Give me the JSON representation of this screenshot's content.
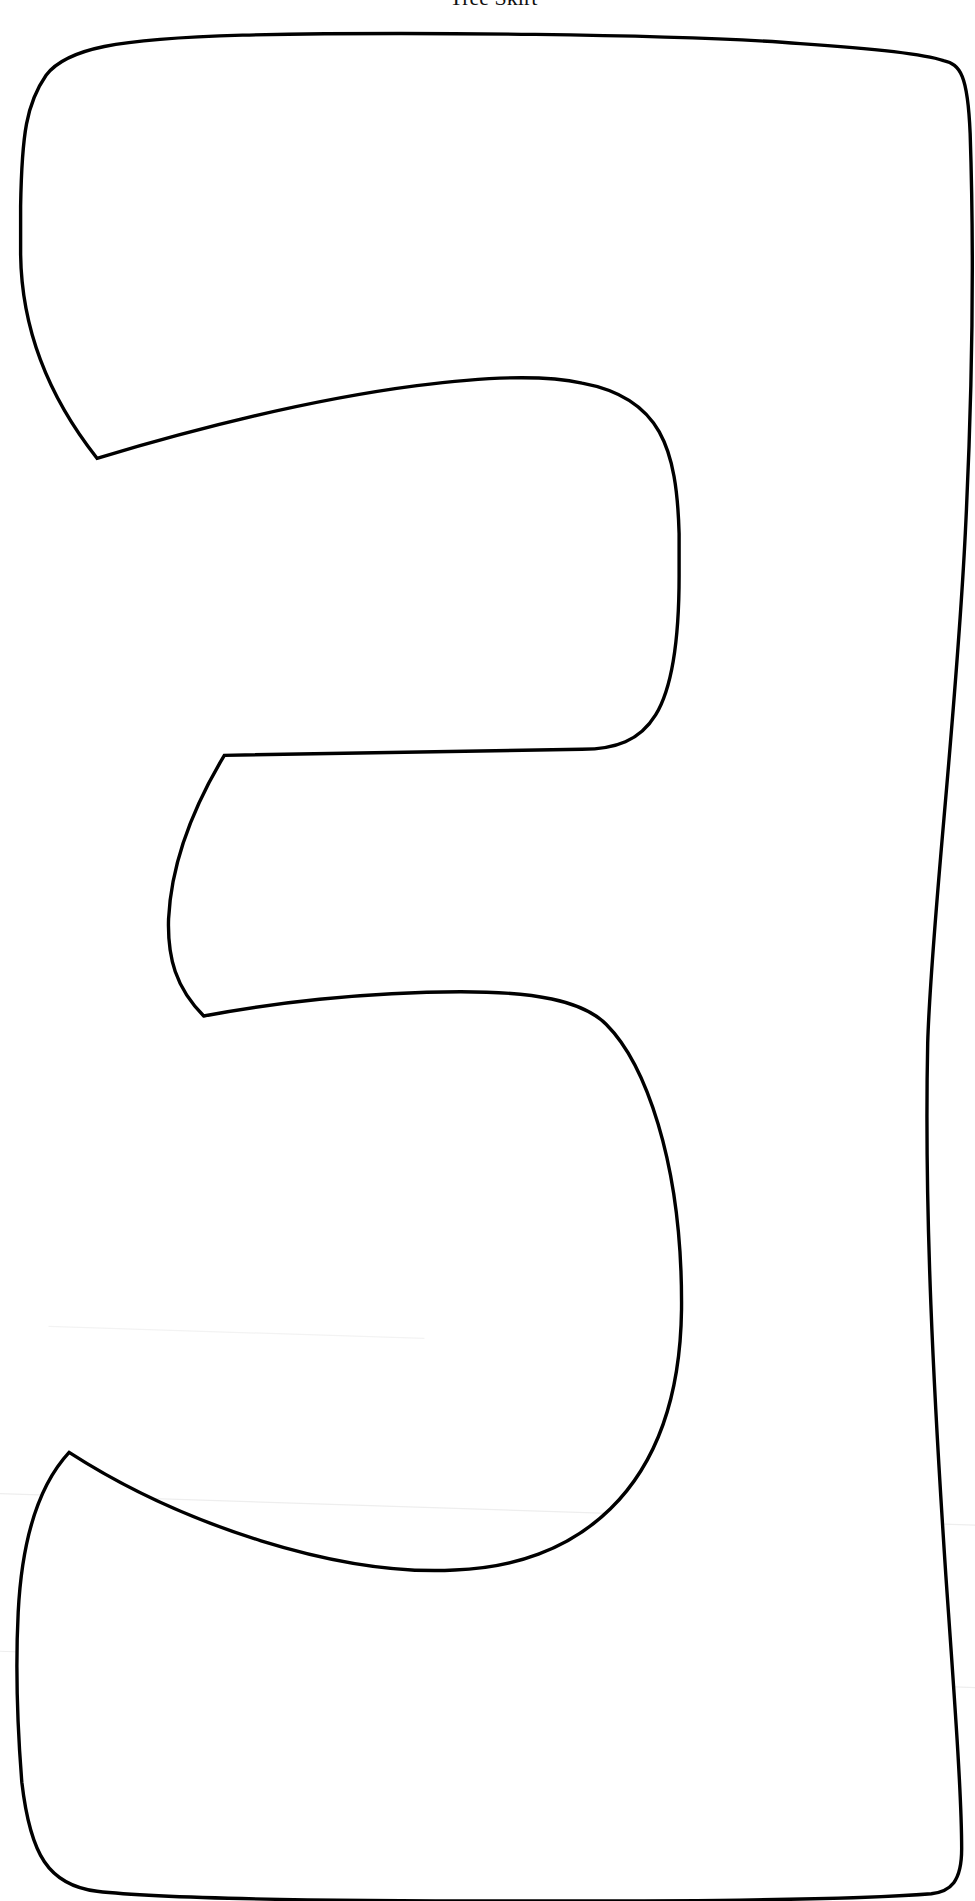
{
  "page": {
    "title": "Tree Skirt",
    "template": {
      "description": "Outline pattern of the numeral 3",
      "numeral": "3",
      "stroke_color": "#000000",
      "background_color": "#ffffff"
    }
  }
}
